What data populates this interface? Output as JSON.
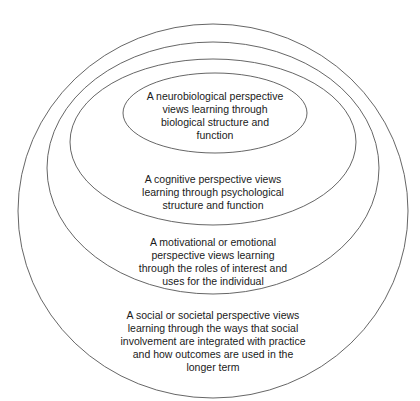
{
  "diagram": {
    "type": "nested-ellipses",
    "stroke_color": "#555555",
    "layers": [
      {
        "id": "social",
        "lines": [
          "A social or societal perspective views",
          "learning through the ways that social",
          "involvement are integrated with practice",
          "and how outcomes are used in the",
          "longer term"
        ]
      },
      {
        "id": "motivational",
        "lines": [
          "A motivational or emotional",
          "perspective views learning",
          "through the roles of interest and",
          "uses for the individual"
        ]
      },
      {
        "id": "cognitive",
        "lines": [
          "A cognitive perspective views",
          "learning through psychological",
          "structure and function"
        ]
      },
      {
        "id": "neurobiological",
        "lines": [
          "A neurobiological perspective",
          "views learning through",
          "biological structure and",
          "function"
        ]
      }
    ]
  }
}
